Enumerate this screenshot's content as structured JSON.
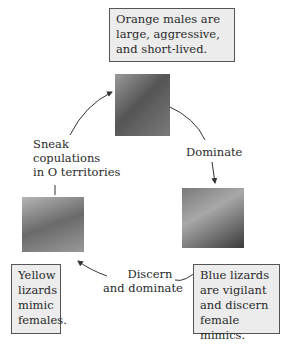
{
  "diagram": {
    "type": "cycle",
    "nodes": [
      {
        "id": "orange",
        "caption": "Orange males are large, aggressive, and short-lived."
      },
      {
        "id": "blue",
        "caption": "Blue lizards are vigilant and discern female mimics."
      },
      {
        "id": "yellow",
        "caption": "Yellow lizards mimic females."
      }
    ],
    "edges": [
      {
        "from": "orange",
        "to": "blue",
        "label": "Dominate"
      },
      {
        "from": "blue",
        "to": "yellow",
        "label": "Discern and dominate"
      },
      {
        "from": "yellow",
        "to": "orange",
        "label": "Sneak copulations in O territories"
      }
    ],
    "colors": {
      "box_fill": "#ececec",
      "box_border": "#555555",
      "arrow": "#333333"
    }
  },
  "text": {
    "orange": [
      "Orange males are",
      "large, aggressive,",
      "and short-lived."
    ],
    "blue": [
      "Blue lizards",
      "are vigilant",
      "and discern",
      "female mimics."
    ],
    "yellow": [
      "Yellow",
      "lizards",
      "mimic",
      "females."
    ],
    "dominate": "Dominate",
    "discern": [
      "Discern",
      "and dominate"
    ],
    "sneak": [
      "Sneak",
      "copulations",
      "in O territories"
    ]
  }
}
